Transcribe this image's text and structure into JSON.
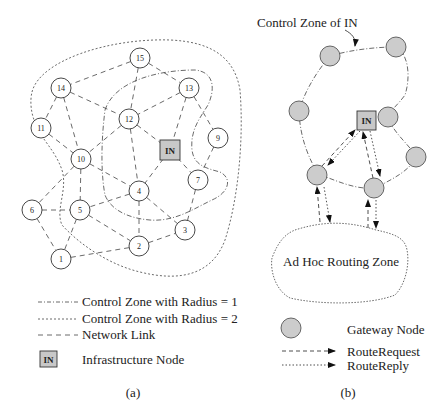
{
  "panel_a": {
    "caption": "(a)",
    "nodes": [
      {
        "id": "15",
        "label": "15"
      },
      {
        "id": "14",
        "label": "14"
      },
      {
        "id": "13",
        "label": "13"
      },
      {
        "id": "12",
        "label": "12"
      },
      {
        "id": "11",
        "label": "11"
      },
      {
        "id": "9",
        "label": "9"
      },
      {
        "id": "10",
        "label": "10"
      },
      {
        "id": "7",
        "label": "7"
      },
      {
        "id": "4",
        "label": "4"
      },
      {
        "id": "6",
        "label": "6"
      },
      {
        "id": "5",
        "label": "5"
      },
      {
        "id": "3",
        "label": "3"
      },
      {
        "id": "2",
        "label": "2"
      },
      {
        "id": "1",
        "label": "1"
      }
    ],
    "infrastructure_node_label": "IN",
    "links": [
      [
        "15",
        "14"
      ],
      [
        "15",
        "12"
      ],
      [
        "15",
        "13"
      ],
      [
        "14",
        "12"
      ],
      [
        "14",
        "11"
      ],
      [
        "14",
        "10"
      ],
      [
        "13",
        "12"
      ],
      [
        "13",
        "IN"
      ],
      [
        "13",
        "9"
      ],
      [
        "12",
        "IN"
      ],
      [
        "12",
        "10"
      ],
      [
        "12",
        "4"
      ],
      [
        "11",
        "10"
      ],
      [
        "9",
        "7"
      ],
      [
        "IN",
        "4"
      ],
      [
        "IN",
        "7"
      ],
      [
        "10",
        "4"
      ],
      [
        "10",
        "5"
      ],
      [
        "10",
        "6"
      ],
      [
        "7",
        "3"
      ],
      [
        "4",
        "5"
      ],
      [
        "4",
        "2"
      ],
      [
        "4",
        "3"
      ],
      [
        "6",
        "5"
      ],
      [
        "6",
        "1"
      ],
      [
        "5",
        "1"
      ],
      [
        "5",
        "2"
      ],
      [
        "1",
        "2"
      ],
      [
        "2",
        "3"
      ]
    ],
    "legend": [
      {
        "style": "dash-dot",
        "label": "Control Zone with Radius = 1"
      },
      {
        "style": "dotted",
        "label": "Control Zone with Radius = 2"
      },
      {
        "style": "dashed",
        "label": "Network Link"
      },
      {
        "style": "in-box",
        "label": "Infrastructure Node",
        "box_label": "IN"
      }
    ]
  },
  "panel_b": {
    "caption": "(b)",
    "annotation": "Control Zone of IN",
    "infrastructure_node_label": "IN",
    "zone_label": "Ad Hoc Routing Zone",
    "gateway_count": 7,
    "legend": [
      {
        "style": "gateway",
        "label": "Gateway Node"
      },
      {
        "style": "dashed-arrow",
        "label": "RouteRequest"
      },
      {
        "style": "dotted-arrow",
        "label": "RouteReply"
      }
    ]
  },
  "colors": {
    "stroke": "#333333",
    "gateway_fill": "#cccccc",
    "in_fill": "#c8c8c8"
  }
}
